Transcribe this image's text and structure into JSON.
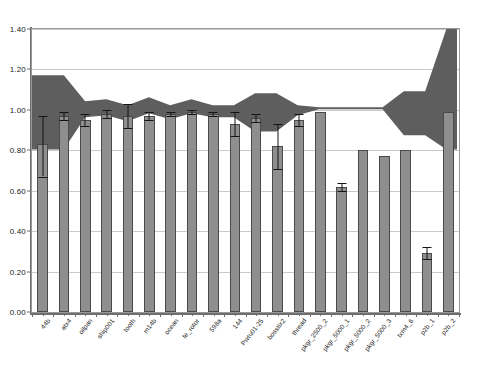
{
  "chart_data": {
    "type": "bar",
    "title": "",
    "subtitle": "",
    "xlabel": "",
    "ylabel": "",
    "ylim": [
      0.0,
      1.4
    ],
    "ytick_labels": [
      "0.00",
      "0.20",
      "0.40",
      "0.60",
      "0.80",
      "1.00",
      "1.20",
      "1.40"
    ],
    "ytick_values": [
      0.0,
      0.2,
      0.4,
      0.6,
      0.8,
      1.0,
      1.2,
      1.4
    ],
    "grid": true,
    "grid_axis": "y",
    "legend": "none",
    "legend_position": "none",
    "categories": [
      "44b",
      "atx4",
      "oilpan",
      "ship001",
      "tooth",
      "m14b",
      "ocean",
      "fe_rotor",
      "598a",
      "144",
      "Pwtu01-25",
      "bosstix2",
      "thread",
      "pkgr_2500_2",
      "pkgr_5000_1",
      "pkgr_5000_2",
      "pkgr_5000_3",
      "txm4_6",
      "p2b_1",
      "p2b_2"
    ],
    "series": [
      {
        "name": "bar-values",
        "type": "bar",
        "color": "#8e8e8e",
        "edge_color": "#4a4a4a",
        "values": [
          0.83,
          0.97,
          0.95,
          0.98,
          0.97,
          0.97,
          0.98,
          0.99,
          0.98,
          0.93,
          0.96,
          0.82,
          0.95,
          0.99,
          0.62,
          0.8,
          0.77,
          0.8,
          0.29,
          0.99
        ],
        "errors_upper": [
          0.14,
          0.02,
          0.03,
          0.02,
          0.06,
          0.02,
          0.01,
          0.01,
          0.01,
          0.06,
          0.02,
          0.11,
          0.03,
          0.0,
          0.02,
          0.0,
          0.0,
          0.0,
          0.03,
          0.0
        ],
        "errors_lower": [
          0.16,
          0.02,
          0.03,
          0.02,
          0.06,
          0.02,
          0.01,
          0.01,
          0.01,
          0.06,
          0.02,
          0.11,
          0.03,
          0.0,
          0.02,
          0.0,
          0.0,
          0.0,
          0.03,
          0.0
        ]
      },
      {
        "name": "envelope-upper",
        "type": "area-upper",
        "color": "#5e5e5e",
        "values": [
          1.17,
          1.17,
          1.04,
          1.05,
          1.02,
          1.06,
          1.02,
          1.05,
          1.02,
          1.02,
          1.08,
          1.08,
          1.02,
          1.01,
          1.01,
          1.01,
          1.01,
          1.09,
          1.09,
          1.4
        ]
      },
      {
        "name": "envelope-lower",
        "type": "area-lower",
        "color": "#5e5e5e",
        "values": [
          0.8,
          0.8,
          0.96,
          0.97,
          0.94,
          0.98,
          0.95,
          0.98,
          0.96,
          0.96,
          0.89,
          0.89,
          0.97,
          1.0,
          1.0,
          1.0,
          1.0,
          0.87,
          0.87,
          0.8
        ]
      }
    ]
  },
  "axes": {
    "y_min_label": "0.00",
    "y_max_label": "1.40"
  }
}
